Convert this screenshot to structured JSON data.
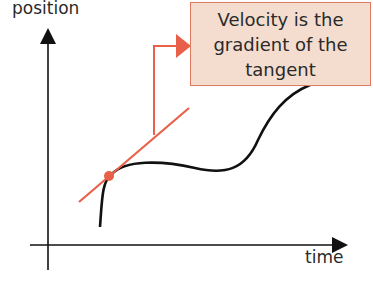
{
  "axes": {
    "y_label": "position",
    "x_label": "time"
  },
  "callout": {
    "line1": "Velocity is the",
    "line2": "gradient of the",
    "line3": "tangent"
  },
  "colors": {
    "accent": "#e8604a",
    "callout_bg": "#f4ddcf",
    "curve": "#111111"
  }
}
